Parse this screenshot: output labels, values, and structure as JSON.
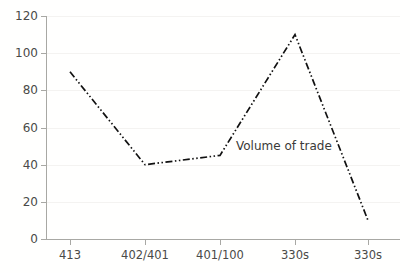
{
  "chart_data": {
    "type": "line",
    "title": "",
    "xlabel": "",
    "ylabel": "",
    "categories": [
      "413",
      "402/401",
      "401/100",
      "330s",
      "330s"
    ],
    "values": [
      90,
      40,
      45,
      110,
      10
    ],
    "series": [
      {
        "name": "Volume of trade",
        "values": [
          90,
          40,
          45,
          110,
          10
        ]
      }
    ],
    "ylim": [
      0,
      120
    ],
    "yticks": [
      0,
      20,
      40,
      60,
      80,
      100,
      120
    ],
    "ytick_labels": [
      "0",
      "20",
      "40",
      "60",
      "80",
      "100",
      "120"
    ],
    "grid": true,
    "grid_axis": "y",
    "legend": "none",
    "line_style": "dash-dot-dot",
    "line_color": "#111111",
    "annotations": [
      {
        "text": "Volume of trade",
        "x_value": "401/100",
        "y_value": 45
      }
    ]
  },
  "axis": {
    "y_ticks": [
      {
        "label": "120",
        "value": 120
      },
      {
        "label": "100",
        "value": 100
      },
      {
        "label": "80",
        "value": 80
      },
      {
        "label": "60",
        "value": 60
      },
      {
        "label": "40",
        "value": 40
      },
      {
        "label": "20",
        "value": 20
      },
      {
        "label": "0",
        "value": 0
      }
    ],
    "x_ticks": [
      {
        "label": "413"
      },
      {
        "label": "402/401"
      },
      {
        "label": "401/100"
      },
      {
        "label": "330s"
      },
      {
        "label": "330s"
      }
    ]
  },
  "annotation": {
    "volume_label": "Volume of trade"
  },
  "colors": {
    "axis": "#a8a8a4",
    "grid": "#f4f3f1",
    "line": "#111111",
    "text": "#4a4a48",
    "background": "#fffffe"
  }
}
